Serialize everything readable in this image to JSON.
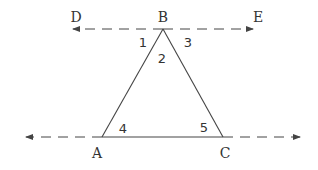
{
  "diagram": {
    "type": "geometry",
    "colors": {
      "stroke": "#444444",
      "text": "#333333",
      "background": "#ffffff"
    },
    "points": {
      "A": {
        "label": "A",
        "x": 102,
        "y": 137
      },
      "B": {
        "label": "B",
        "x": 163,
        "y": 29
      },
      "C": {
        "label": "C",
        "x": 223,
        "y": 137
      },
      "D": {
        "label": "D",
        "x": 73,
        "y": 29
      },
      "E": {
        "label": "E",
        "x": 253,
        "y": 29
      }
    },
    "angles": [
      {
        "label": "1",
        "at": "B",
        "between": "BD and BA"
      },
      {
        "label": "2",
        "at": "B",
        "between": "BA and BC"
      },
      {
        "label": "3",
        "at": "B",
        "between": "BC and BE"
      },
      {
        "label": "4",
        "at": "A",
        "between": "AC and AB"
      },
      {
        "label": "5",
        "at": "C",
        "between": "CA and CB"
      }
    ],
    "lines": [
      {
        "name": "DE",
        "style": "dashed",
        "arrows": "both",
        "through": "B"
      },
      {
        "name": "AC extended",
        "style": "dashed extension",
        "arrows": "both"
      },
      {
        "name": "AB",
        "style": "solid"
      },
      {
        "name": "BC",
        "style": "solid"
      },
      {
        "name": "AC",
        "style": "solid"
      }
    ]
  }
}
